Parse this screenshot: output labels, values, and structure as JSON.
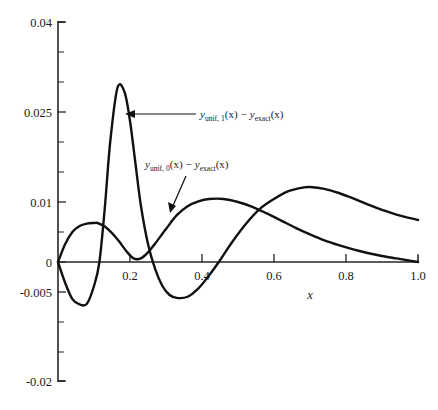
{
  "chart_data": {
    "type": "line",
    "title": "",
    "subtitle": "",
    "xlabel": "x",
    "ylabel": "",
    "xlim": [
      0,
      1.0
    ],
    "ylim": [
      -0.02,
      0.04
    ],
    "grid": false,
    "legend_position": "inline-annotations",
    "x_ticks": [
      {
        "value": 0.2,
        "label": "0.2"
      },
      {
        "value": 0.4,
        "label": "0.4"
      },
      {
        "value": 0.6,
        "label": "0.6"
      },
      {
        "value": 0.8,
        "label": "0.8"
      },
      {
        "value": 1.0,
        "label": "1.0"
      }
    ],
    "y_ticks": [
      {
        "value": 0.04,
        "label": "0.04"
      },
      {
        "value": 0.025,
        "label": "0.025"
      },
      {
        "value": 0.01,
        "label": "0.01"
      },
      {
        "value": 0.0,
        "label": "0"
      },
      {
        "value": -0.005,
        "label": "-0.005"
      },
      {
        "value": -0.02,
        "label": "-0.02"
      }
    ],
    "series": [
      {
        "name": "y_unif,1 minus y_exact",
        "label_parts": {
          "var1": "y",
          "sub1": "unif, 1",
          "arg1": "(x)",
          "operator": "−",
          "var2": "y",
          "sub2": "exact",
          "arg2": "(x)"
        },
        "x": [
          0.0,
          0.02,
          0.04,
          0.06,
          0.08,
          0.1,
          0.115,
          0.13,
          0.145,
          0.165,
          0.185,
          0.2,
          0.215,
          0.23,
          0.25,
          0.27,
          0.29,
          0.31,
          0.33,
          0.36,
          0.39,
          0.42,
          0.45,
          0.48,
          0.52,
          0.56,
          0.6,
          0.64,
          0.68,
          0.7,
          0.74,
          0.78,
          0.82,
          0.86,
          0.9,
          0.94,
          1.0
        ],
        "y": [
          0.0,
          -0.0035,
          -0.0062,
          -0.0071,
          -0.007,
          -0.004,
          0.0,
          0.009,
          0.02,
          0.029,
          0.0283,
          0.0235,
          0.0165,
          0.0095,
          0.003,
          -0.0012,
          -0.004,
          -0.0055,
          -0.006,
          -0.0058,
          -0.0044,
          -0.0022,
          0.0003,
          0.003,
          0.0062,
          0.0088,
          0.0105,
          0.0118,
          0.0124,
          0.0125,
          0.0122,
          0.0115,
          0.0106,
          0.0096,
          0.0087,
          0.0079,
          0.007
        ]
      },
      {
        "name": "y_unif,0 minus y_exact",
        "label_parts": {
          "var1": "y",
          "sub1": "unif, 0",
          "arg1": "(x)",
          "operator": "−",
          "var2": "y",
          "sub2": "exact",
          "arg2": "(x)"
        },
        "x": [
          0.0,
          0.02,
          0.04,
          0.06,
          0.08,
          0.1,
          0.11,
          0.13,
          0.15,
          0.17,
          0.19,
          0.21,
          0.23,
          0.25,
          0.27,
          0.3,
          0.33,
          0.36,
          0.39,
          0.42,
          0.46,
          0.5,
          0.54,
          0.58,
          0.62,
          0.66,
          0.7,
          0.74,
          0.78,
          0.82,
          0.86,
          0.9,
          0.94,
          0.97,
          1.0
        ],
        "y": [
          0.0,
          0.003,
          0.005,
          0.006,
          0.0064,
          0.0065,
          0.0065,
          0.0059,
          0.0048,
          0.0034,
          0.0018,
          0.0006,
          0.0006,
          0.0016,
          0.0031,
          0.0055,
          0.0078,
          0.0093,
          0.0101,
          0.0105,
          0.0105,
          0.01,
          0.0092,
          0.0081,
          0.0069,
          0.0057,
          0.0046,
          0.0036,
          0.0028,
          0.0021,
          0.0015,
          0.001,
          0.0006,
          0.0003,
          0.0
        ]
      }
    ],
    "annotations": [
      {
        "id": "annotation-unif-1",
        "text": "y_unif, 1(x) − y_exact(x)",
        "has_arrow": true,
        "points_to_series": "y_unif,1 minus y_exact"
      },
      {
        "id": "annotation-unif-0",
        "text": "y_unif, 0(x) − y_exact(x)",
        "has_arrow": true,
        "points_to_series": "y_unif,0 minus y_exact"
      }
    ],
    "colors": {
      "curve": "#111111",
      "axis": "#262626",
      "background": "#ffffff"
    }
  }
}
